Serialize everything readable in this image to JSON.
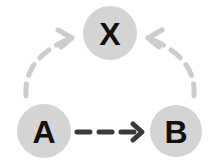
{
  "diagram": {
    "type": "causal-graph",
    "nodes": [
      {
        "id": "X",
        "label": "X",
        "cx": 110,
        "cy": 33,
        "r": 27
      },
      {
        "id": "A",
        "label": "A",
        "cx": 44,
        "cy": 131,
        "r": 27
      },
      {
        "id": "B",
        "label": "B",
        "cx": 176,
        "cy": 131,
        "r": 26
      }
    ],
    "edges": [
      {
        "from": "A",
        "to": "B",
        "style": "dashed",
        "color": "#3a3a3a"
      },
      {
        "from": "A",
        "to": "X",
        "style": "dashed-curved",
        "color": "#cccccc"
      },
      {
        "from": "B",
        "to": "X",
        "style": "dashed-curved",
        "color": "#cccccc"
      }
    ]
  },
  "colors": {
    "node_fill": "#d4d4d4",
    "label": "#111111",
    "edge_dark": "#3a3a3a",
    "edge_light": "#cccccc"
  }
}
